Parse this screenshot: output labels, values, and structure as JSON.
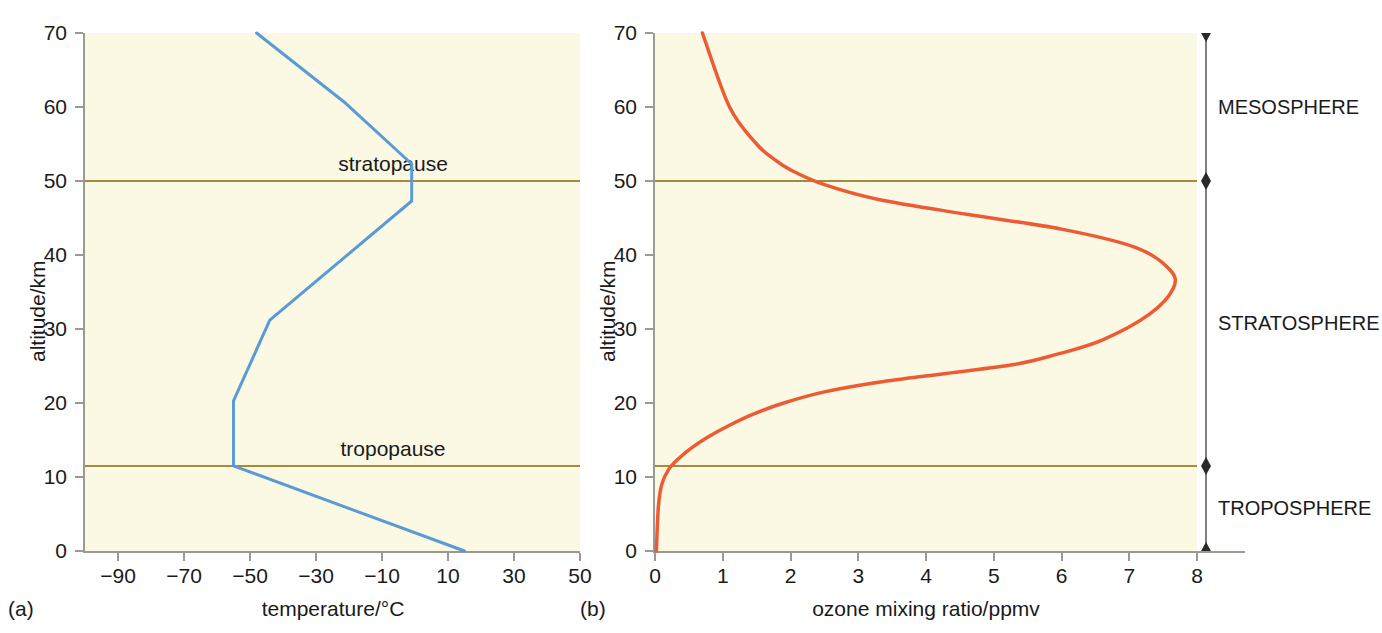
{
  "figure": {
    "background_color": "#ffffff",
    "panel_background_color": "#fbf8e4",
    "boundary_line_color": "#a58b39",
    "axis_color": "#9a9a92"
  },
  "panel_a": {
    "caption": "(a)",
    "xlabel": "temperature/°C",
    "ylabel": "altitude/km",
    "line_color": "#5b9bd5",
    "x_ticks": [
      "−90",
      "−70",
      "−50",
      "−30",
      "−10",
      "10",
      "30",
      "50"
    ],
    "y_ticks": [
      "0",
      "10",
      "20",
      "30",
      "40",
      "50",
      "60",
      "70"
    ],
    "boundaries": [
      {
        "name": "stratopause",
        "label": "stratopause",
        "altitude": 50
      },
      {
        "name": "tropopause",
        "label": "tropopause",
        "altitude": 11.5
      }
    ]
  },
  "panel_b": {
    "caption": "(b)",
    "xlabel": "ozone mixing ratio/ppmv",
    "ylabel": "altitude/km",
    "line_color": "#ec5c34",
    "x_ticks": [
      "0",
      "1",
      "2",
      "3",
      "4",
      "5",
      "6",
      "7",
      "8"
    ],
    "y_ticks": [
      "0",
      "10",
      "20",
      "30",
      "40",
      "50",
      "60",
      "70"
    ],
    "boundaries": [
      {
        "name": "stratopause",
        "altitude": 50
      },
      {
        "name": "tropopause",
        "altitude": 11.5
      }
    ],
    "layers": [
      {
        "label": "MESOSPHERE",
        "top": 70,
        "bottom": 50
      },
      {
        "label": "STRATOSPHERE",
        "top": 50,
        "bottom": 11.5
      },
      {
        "label": "TROPOSPHERE",
        "top": 11.5,
        "bottom": 0
      }
    ]
  },
  "chart_data": [
    {
      "type": "line",
      "title": "",
      "panel": "(a)",
      "xlabel": "temperature/°C",
      "ylabel": "altitude/km",
      "xlim": [
        -100,
        50
      ],
      "ylim": [
        0,
        70
      ],
      "xticks": [
        -90,
        -70,
        -50,
        -30,
        -10,
        10,
        30,
        50
      ],
      "yticks": [
        0,
        10,
        20,
        30,
        40,
        50,
        60,
        70
      ],
      "grid": false,
      "legend": "none",
      "series": [
        {
          "name": "temperature",
          "color": "#5b9bd5",
          "x": [
            15,
            -55,
            -55,
            -44,
            -1,
            -1,
            -21,
            -48
          ],
          "y": [
            0,
            11.5,
            20.3,
            31.2,
            47.3,
            52.3,
            60.5,
            70
          ],
          "note": "x = temperature/°C, y = altitude/km"
        }
      ],
      "annotations": [
        {
          "text": "stratopause",
          "y": 50
        },
        {
          "text": "tropopause",
          "y": 11.5
        }
      ]
    },
    {
      "type": "line",
      "title": "",
      "panel": "(b)",
      "xlabel": "ozone mixing ratio/ppmv",
      "ylabel": "altitude/km",
      "xlim": [
        0,
        8.6
      ],
      "ylim": [
        0,
        70
      ],
      "xticks": [
        0,
        1,
        2,
        3,
        4,
        5,
        6,
        7,
        8
      ],
      "yticks": [
        0,
        10,
        20,
        30,
        40,
        50,
        60,
        70
      ],
      "grid": false,
      "legend": "none",
      "series": [
        {
          "name": "ozone mixing ratio",
          "color": "#ec5c34",
          "x": [
            0.02,
            0.05,
            0.1,
            0.2,
            0.35,
            0.55,
            0.8,
            1.1,
            1.45,
            1.9,
            2.5,
            3.3,
            4.3,
            5.3,
            5.9,
            6.6,
            7.3,
            7.65,
            7.6,
            7.1,
            6.0,
            4.6,
            3.3,
            2.5,
            2.0,
            1.75,
            1.5,
            1.1,
            0.7
          ],
          "y": [
            0,
            6,
            9,
            11,
            12.5,
            14,
            15.5,
            17,
            18.5,
            20,
            21.5,
            22.8,
            24.0,
            25.2,
            26.5,
            28.5,
            32,
            35.5,
            38,
            41,
            43.5,
            45.5,
            47.5,
            49.5,
            51.5,
            53,
            55,
            60,
            70
          ],
          "note": "x = ozone mixing ratio/ppmv, y = altitude/km"
        }
      ],
      "annotations": [
        {
          "text": "MESOSPHERE",
          "range_km": [
            50,
            70
          ]
        },
        {
          "text": "STRATOSPHERE",
          "range_km": [
            11.5,
            50
          ]
        },
        {
          "text": "TROPOSPHERE",
          "range_km": [
            0,
            11.5
          ]
        }
      ]
    }
  ]
}
